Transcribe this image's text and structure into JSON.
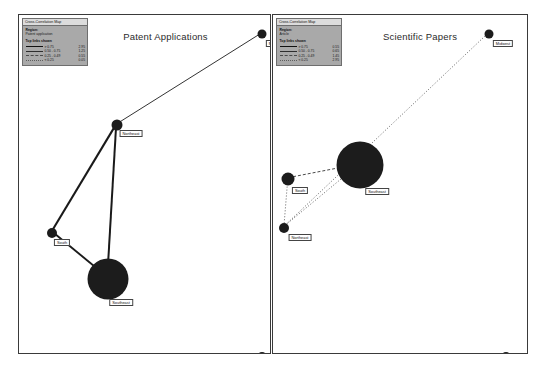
{
  "panels": [
    {
      "id": "patent-applications",
      "title": "Patent Applications",
      "legend": {
        "header": "Cross-Correlation Map",
        "field_label": "Region:",
        "field_value": "Patent application",
        "section_title": "Top links shown",
        "rows": [
          {
            "style": "solid-thick",
            "range": "> 0.75",
            "count": "2.95"
          },
          {
            "style": "solid-thin",
            "range": "0.50 - 0.75",
            "count": "1.25"
          },
          {
            "style": "dashed",
            "range": "0.25 - 0.49",
            "count": "0.55"
          },
          {
            "style": "dotted",
            "range": "< 0.25",
            "count": "0.05"
          }
        ]
      },
      "nodes": [
        {
          "name": "Midwest",
          "label": "Midwest",
          "x": 243,
          "y": 19,
          "size": 9,
          "label_dx": 14,
          "label_dy": 6
        },
        {
          "name": "Northeast",
          "label": "Northeast",
          "x": 98,
          "y": 110,
          "size": 11,
          "label_dx": 14,
          "label_dy": 5
        },
        {
          "name": "South",
          "label": "South",
          "x": 33,
          "y": 218,
          "size": 10,
          "label_dx": 10,
          "label_dy": 6
        },
        {
          "name": "Southeast",
          "label": "Southeast",
          "x": 89,
          "y": 264,
          "size": 41,
          "label_dx": 13,
          "label_dy": 20
        },
        {
          "name": "North",
          "label": "North",
          "x": 243,
          "y": 341,
          "size": 8,
          "label_dx": 12,
          "label_dy": 5
        }
      ],
      "edges": [
        {
          "from": "Midwest",
          "to": "Northeast",
          "style": "solid-thin",
          "width": 0.9
        },
        {
          "from": "Northeast",
          "to": "South",
          "style": "solid-thick",
          "width": 2.1
        },
        {
          "from": "Northeast",
          "to": "Southeast",
          "style": "solid-thick",
          "width": 2.0
        },
        {
          "from": "South",
          "to": "Southeast",
          "style": "solid-thick",
          "width": 1.9
        }
      ]
    },
    {
      "id": "scientific-papers",
      "title": "Scientific Papers",
      "legend": {
        "header": "Cross-Correlation Map",
        "field_label": "Region:",
        "field_value": "Article",
        "section_title": "Top links shown",
        "rows": [
          {
            "style": "solid-thick",
            "range": "> 0.75",
            "count": "0.55"
          },
          {
            "style": "solid-thin",
            "range": "0.50 - 0.75",
            "count": "0.65"
          },
          {
            "style": "dashed",
            "range": "0.25 - 0.49",
            "count": "1.45"
          },
          {
            "style": "dotted",
            "range": "< 0.25",
            "count": "2.95"
          }
        ]
      },
      "nodes": [
        {
          "name": "Midwest",
          "label": "Midwest",
          "x": 216,
          "y": 19,
          "size": 9,
          "label_dx": 14,
          "label_dy": 6
        },
        {
          "name": "Southeast",
          "label": "Southeast",
          "x": 87,
          "y": 150,
          "size": 47,
          "label_dx": 17,
          "label_dy": 23
        },
        {
          "name": "South",
          "label": "South",
          "x": 15,
          "y": 164,
          "size": 13,
          "label_dx": 12,
          "label_dy": 8
        },
        {
          "name": "Northeast",
          "label": "Northeast",
          "x": 11,
          "y": 213,
          "size": 10,
          "label_dx": 16,
          "label_dy": 6
        },
        {
          "name": "North",
          "label": "North",
          "x": 233,
          "y": 341,
          "size": 8,
          "label_dx": 12,
          "label_dy": 5
        }
      ],
      "edges": [
        {
          "from": "Midwest",
          "to": "Northeast",
          "style": "dotted",
          "width": 0.7
        },
        {
          "from": "Southeast",
          "to": "South",
          "style": "dashed",
          "width": 0.8
        },
        {
          "from": "Southeast",
          "to": "Northeast",
          "style": "dotted",
          "width": 0.7
        },
        {
          "from": "South",
          "to": "Northeast",
          "style": "dotted",
          "width": 0.7
        }
      ]
    }
  ],
  "colors": {
    "node": "#1c1c1c",
    "edge": "#1a1a1a",
    "panel_border": "#3a3a3a",
    "legend_bg": "#a9a9a9",
    "legend_header_bg": "#dcdcdc",
    "background": "#ffffff"
  }
}
